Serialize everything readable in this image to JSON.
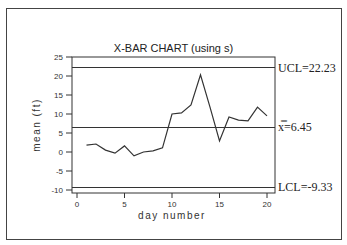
{
  "chart_data": {
    "type": "line",
    "title": "X-BAR CHART (using s)",
    "xlabel": "day number",
    "ylabel": "mean (ft)",
    "xlim": [
      0,
      21
    ],
    "ylim": [
      -10,
      25
    ],
    "xticks": [
      0,
      5,
      10,
      15,
      20
    ],
    "yticks": [
      25,
      20,
      15,
      10,
      5,
      0,
      -5,
      -10
    ],
    "grid": false,
    "x": [
      1,
      2,
      3,
      4,
      5,
      6,
      7,
      8,
      9,
      10,
      11,
      12,
      13,
      14,
      15,
      16,
      17,
      18,
      19,
      20
    ],
    "series": [
      {
        "name": "sample mean",
        "values": [
          1.8,
          2.1,
          0.5,
          -0.3,
          1.6,
          -1.0,
          0.0,
          0.3,
          1.1,
          10.0,
          10.3,
          12.4,
          20.3,
          11.8,
          2.9,
          9.2,
          8.4,
          8.2,
          11.8,
          9.5
        ]
      }
    ],
    "control_lines": {
      "ucl": {
        "value": 22.23,
        "label": "UCL=22.23"
      },
      "center": {
        "value": 6.45,
        "label": "x̿=6.45"
      },
      "lcl": {
        "value": -9.33,
        "label": "LCL=-9.33"
      }
    }
  }
}
